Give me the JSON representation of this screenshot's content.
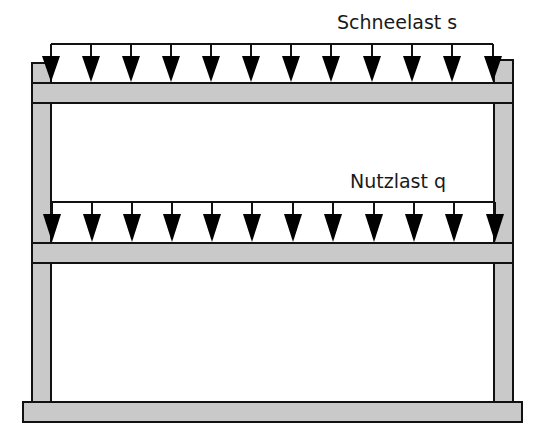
{
  "diagram": {
    "type": "structural-frame-loads",
    "colors": {
      "member_fill": "#c9c9c9",
      "outline": "#111111",
      "arrow": "#000000",
      "text": "#1a1a1a"
    },
    "loads": [
      {
        "id": "snow",
        "label": "Schneelast s",
        "label_x": 337,
        "label_y": 29,
        "line_y": 44,
        "x_start": 51,
        "x_end": 493,
        "arrow_head_top": 56,
        "arrow_tip": 82,
        "arrow_x": [
          51,
          91,
          131,
          171,
          211,
          251,
          291,
          331,
          372,
          412,
          452,
          493
        ]
      },
      {
        "id": "live",
        "label": "Nutzlast q",
        "label_x": 350,
        "label_y": 188,
        "line_y": 202,
        "x_start": 52,
        "x_end": 495,
        "arrow_head_top": 214,
        "arrow_tip": 242,
        "arrow_x": [
          52,
          92,
          132,
          172,
          212,
          252,
          293,
          333,
          374,
          414,
          454,
          495
        ]
      }
    ],
    "members": {
      "left_column": {
        "x": 32,
        "y": 63,
        "w": 19,
        "h": 340
      },
      "right_column": {
        "x": 494,
        "y": 60,
        "w": 19,
        "h": 343
      },
      "roof_beam": {
        "x": 32,
        "y": 83,
        "w": 481,
        "h": 20
      },
      "floor_beam": {
        "x": 32,
        "y": 243,
        "w": 481,
        "h": 20
      },
      "base_slab": {
        "x": 23,
        "y": 402,
        "w": 499,
        "h": 20
      }
    }
  }
}
